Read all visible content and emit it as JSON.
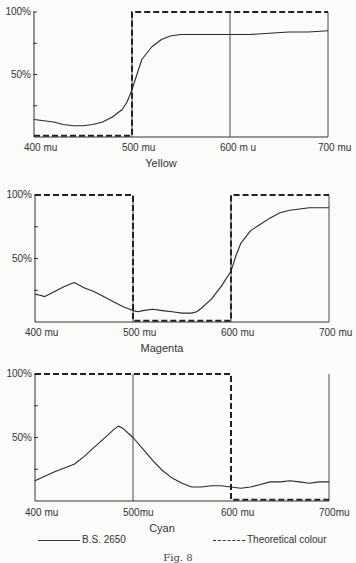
{
  "figure": {
    "caption": "Fig. 8",
    "legend": {
      "measured_label": "B.S. 2650",
      "theoretical_label": "Theoretical colour"
    }
  },
  "chart_data": [
    {
      "type": "line",
      "title": "Yellow",
      "xlabel": "",
      "ylabel": "",
      "x_tick_labels": [
        "400 mu",
        "500 mu",
        "600 m u",
        "700 mu"
      ],
      "y_tick_labels": [
        "50%",
        "100%"
      ],
      "xlim": [
        400,
        700
      ],
      "ylim": [
        0,
        100
      ],
      "series": [
        {
          "name": "B.S. 2650",
          "style": "solid",
          "x": [
            400,
            410,
            420,
            430,
            440,
            450,
            460,
            470,
            480,
            490,
            495,
            500,
            505,
            510,
            520,
            530,
            540,
            550,
            560,
            580,
            600,
            620,
            640,
            660,
            680,
            700
          ],
          "values": [
            14,
            13,
            12,
            10,
            9,
            9,
            10,
            12,
            16,
            22,
            28,
            38,
            50,
            62,
            72,
            78,
            81,
            82,
            82,
            82,
            82,
            82,
            83,
            84,
            84,
            85
          ]
        },
        {
          "name": "Theoretical colour",
          "style": "dashed",
          "x": [
            400,
            500,
            500,
            700,
            700
          ],
          "values": [
            1,
            1,
            100,
            100,
            100
          ]
        }
      ],
      "grid_x": [
        500,
        600,
        700
      ]
    },
    {
      "type": "line",
      "title": "Magenta",
      "xlabel": "",
      "ylabel": "",
      "x_tick_labels": [
        "400 mu",
        "500 mu",
        "600 mu",
        "700 mu"
      ],
      "y_tick_labels": [
        "50%",
        "100%"
      ],
      "xlim": [
        400,
        700
      ],
      "ylim": [
        0,
        100
      ],
      "series": [
        {
          "name": "B.S. 2650",
          "style": "solid",
          "x": [
            400,
            405,
            410,
            420,
            430,
            440,
            450,
            460,
            470,
            480,
            490,
            500,
            505,
            510,
            520,
            530,
            540,
            550,
            560,
            565,
            570,
            580,
            590,
            600,
            605,
            610,
            620,
            630,
            640,
            650,
            660,
            670,
            680,
            690,
            700
          ],
          "values": [
            22,
            21,
            20,
            24,
            28,
            31,
            27,
            24,
            20,
            16,
            12,
            9,
            8,
            9,
            10,
            9,
            8,
            7,
            7,
            8,
            11,
            18,
            28,
            40,
            52,
            62,
            72,
            77,
            82,
            86,
            88,
            89,
            90,
            90,
            90
          ]
        },
        {
          "name": "Theoretical colour",
          "style": "dashed",
          "x": [
            400,
            500,
            500,
            600,
            600,
            700
          ],
          "values": [
            100,
            100,
            1,
            1,
            100,
            100
          ]
        }
      ],
      "grid_x": [
        500,
        600,
        700
      ]
    },
    {
      "type": "line",
      "title": "Cyan",
      "xlabel": "",
      "ylabel": "",
      "x_tick_labels": [
        "400 mu",
        "500mu",
        "600 mu",
        "700mu"
      ],
      "y_tick_labels": [
        "50%",
        "100%"
      ],
      "xlim": [
        400,
        700
      ],
      "ylim": [
        0,
        100
      ],
      "series": [
        {
          "name": "B.S. 2650",
          "style": "solid",
          "x": [
            400,
            420,
            440,
            450,
            460,
            470,
            480,
            485,
            490,
            500,
            510,
            520,
            530,
            540,
            550,
            560,
            570,
            580,
            590,
            600,
            610,
            620,
            630,
            640,
            650,
            660,
            670,
            680,
            690,
            700
          ],
          "values": [
            16,
            23,
            29,
            35,
            42,
            49,
            56,
            59,
            57,
            50,
            41,
            32,
            24,
            18,
            14,
            11,
            11,
            12,
            12,
            11,
            10,
            11,
            13,
            15,
            15,
            16,
            15,
            14,
            15,
            15
          ]
        },
        {
          "name": "Theoretical colour",
          "style": "dashed",
          "x": [
            400,
            600,
            600,
            700
          ],
          "values": [
            100,
            100,
            1,
            1
          ]
        }
      ],
      "grid_x": [
        500,
        700
      ]
    }
  ]
}
